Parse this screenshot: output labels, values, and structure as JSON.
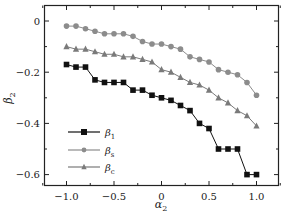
{
  "chart_data": {
    "type": "line",
    "title": "",
    "xlabel": "α2",
    "ylabel": "β2",
    "xlim": [
      -1.25,
      1.25
    ],
    "ylim": [
      -0.64,
      0.06
    ],
    "xticks": [
      -1.0,
      -0.5,
      0,
      0.5,
      1.0
    ],
    "xtick_labels": [
      "−1.0",
      "−0.5",
      "0",
      "0.5",
      "1.0"
    ],
    "yticks": [
      0,
      -0.2,
      -0.4,
      -0.6
    ],
    "ytick_labels": [
      "0",
      "−0.2",
      "−0.4",
      "−0.6"
    ],
    "grid": false,
    "legend_position": "lower left",
    "x": [
      -1.0,
      -0.9,
      -0.8,
      -0.7,
      -0.6,
      -0.5,
      -0.4,
      -0.3,
      -0.2,
      -0.1,
      0.0,
      0.1,
      0.2,
      0.3,
      0.4,
      0.5,
      0.6,
      0.7,
      0.8,
      0.9,
      1.0
    ],
    "series": [
      {
        "name": "β1",
        "marker": "square",
        "color": "#111111",
        "values": [
          -0.17,
          -0.18,
          -0.18,
          -0.23,
          -0.24,
          -0.24,
          -0.24,
          -0.27,
          -0.27,
          -0.29,
          -0.3,
          -0.31,
          -0.33,
          -0.35,
          -0.4,
          -0.42,
          -0.5,
          -0.5,
          -0.5,
          -0.6,
          -0.6
        ]
      },
      {
        "name": "βs",
        "marker": "circle",
        "color": "#8c8c8c",
        "values": [
          -0.02,
          -0.02,
          -0.03,
          -0.04,
          -0.05,
          -0.05,
          -0.05,
          -0.06,
          -0.08,
          -0.09,
          -0.09,
          -0.1,
          -0.11,
          -0.14,
          -0.15,
          -0.16,
          -0.19,
          -0.2,
          -0.21,
          -0.24,
          -0.29
        ]
      },
      {
        "name": "βc",
        "marker": "triangle",
        "color": "#7a7a7a",
        "values": [
          -0.1,
          -0.11,
          -0.11,
          -0.12,
          -0.13,
          -0.13,
          -0.14,
          -0.14,
          -0.15,
          -0.16,
          -0.19,
          -0.2,
          -0.22,
          -0.24,
          -0.25,
          -0.27,
          -0.3,
          -0.32,
          -0.35,
          -0.37,
          -0.41
        ]
      }
    ],
    "legend": [
      {
        "label_main": "β",
        "label_sub": "1"
      },
      {
        "label_main": "β",
        "label_sub": "s"
      },
      {
        "label_main": "β",
        "label_sub": "c"
      }
    ]
  }
}
